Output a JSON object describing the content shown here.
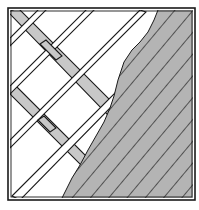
{
  "figure": {
    "title": "",
    "colors": {
      "background": "#ffffff",
      "line": "#1a1a1a",
      "slat_fill": "#c8c8c8",
      "hatch_fill": "#b4b4b4"
    }
  }
}
